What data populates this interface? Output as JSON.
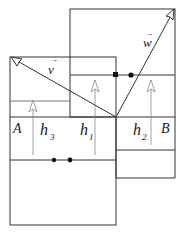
{
  "diagram": {
    "labels": {
      "A": "A",
      "B": "B",
      "h1": "h",
      "h1_sub": "1",
      "h2": "h",
      "h2_sub": "2",
      "h3": "h",
      "h3_sub": "3",
      "v": "v",
      "w": "w",
      "vec_arrow": "→"
    },
    "colors": {
      "line": "#333333",
      "thin_line": "#888888",
      "dot": "#111111"
    }
  }
}
